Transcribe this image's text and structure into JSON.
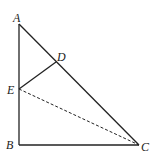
{
  "diagram": {
    "type": "geometry",
    "points": {
      "A": {
        "label": "A",
        "x": 19,
        "y": 24
      },
      "B": {
        "label": "B",
        "x": 19,
        "y": 145
      },
      "C": {
        "label": "C",
        "x": 139,
        "y": 145
      },
      "D": {
        "label": "D",
        "x": 56,
        "y": 62
      },
      "E": {
        "label": "E",
        "x": 19,
        "y": 89
      }
    },
    "segments": [
      {
        "from": "A",
        "to": "B",
        "style": "solid"
      },
      {
        "from": "B",
        "to": "C",
        "style": "solid"
      },
      {
        "from": "A",
        "to": "C",
        "style": "solid"
      },
      {
        "from": "E",
        "to": "D",
        "style": "solid"
      },
      {
        "from": "E",
        "to": "C",
        "style": "dashed"
      }
    ],
    "colors": {
      "stroke": "#222222",
      "background": "#ffffff"
    }
  }
}
